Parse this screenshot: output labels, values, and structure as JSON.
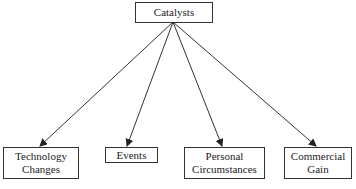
{
  "diagram": {
    "type": "tree",
    "root": {
      "id": "catalysts",
      "label": "Catalysts"
    },
    "children": [
      {
        "id": "technology-changes",
        "lines": [
          "Technology",
          "Changes"
        ]
      },
      {
        "id": "events",
        "lines": [
          "Events"
        ]
      },
      {
        "id": "personal-circumstances",
        "lines": [
          "Personal",
          "Circumstances"
        ]
      },
      {
        "id": "commercial-gain",
        "lines": [
          "Commercial",
          "Gain"
        ]
      }
    ],
    "edges": [
      {
        "from": "catalysts",
        "to": "technology-changes"
      },
      {
        "from": "catalysts",
        "to": "events"
      },
      {
        "from": "catalysts",
        "to": "personal-circumstances"
      },
      {
        "from": "catalysts",
        "to": "commercial-gain"
      }
    ],
    "colors": {
      "line": "#333333",
      "box_border": "#333333",
      "background": "#ffffff"
    }
  }
}
